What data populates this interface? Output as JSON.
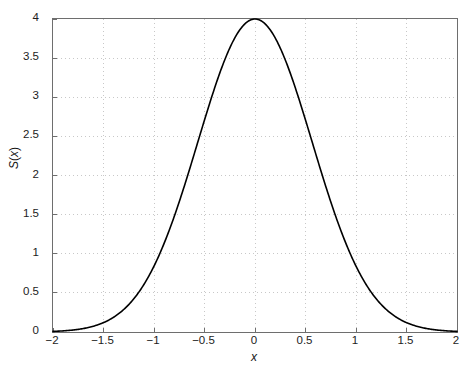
{
  "figure": {
    "background_color": "#ffffff",
    "axes_color": "#6e6e6e",
    "grid_color": "#c8c8c8",
    "curve_color": "#000000"
  },
  "axis": {
    "xlabel": "x",
    "ylabel_prefix": "S",
    "ylabel_arg": "x",
    "ylabel_full": "S(x)"
  },
  "caption_ghost": "",
  "chart_data": {
    "type": "line",
    "title": "",
    "subtitle": "",
    "xlabel": "x",
    "ylabel": "S(x)",
    "xlim": [
      -2,
      2
    ],
    "ylim": [
      0,
      4
    ],
    "grid": true,
    "grid_style": "dotted",
    "legend": null,
    "legend_position": "none",
    "xticks": [
      -2,
      -1.5,
      -1,
      -0.5,
      0,
      0.5,
      1,
      1.5,
      2
    ],
    "xticklabels": [
      "-2",
      "-1.5",
      "-1",
      "-0.5",
      "0",
      "0.5",
      "1",
      "1.5",
      "2"
    ],
    "yticks": [
      0,
      0.5,
      1,
      1.5,
      2,
      2.5,
      3,
      3.5,
      4
    ],
    "yticklabels": [
      "0",
      "0.5",
      "1",
      "1.5",
      "2",
      "2.5",
      "3",
      "3.5",
      "4"
    ],
    "series": [
      {
        "name": "S(x)",
        "color": "#000000",
        "linewidth": 1.6,
        "description": "Gaussian bell curve peaking at 4 when x = 0",
        "x": [
          -2,
          -1.9,
          -1.8,
          -1.7,
          -1.6,
          -1.5,
          -1.4,
          -1.3,
          -1.2,
          -1.1,
          -1,
          -0.9,
          -0.8,
          -0.7,
          -0.6,
          -0.5,
          -0.4,
          -0.3,
          -0.2,
          -0.1,
          0,
          0.1,
          0.2,
          0.3,
          0.4,
          0.5,
          0.6,
          0.7,
          0.8,
          0.9,
          1,
          1.1,
          1.2,
          1.3,
          1.4,
          1.5,
          1.6,
          1.7,
          1.8,
          1.9,
          2
        ],
        "y": [
          0.015,
          0.024,
          0.04,
          0.063,
          0.098,
          0.148,
          0.22,
          0.318,
          0.45,
          0.623,
          0.842,
          1.113,
          1.44,
          1.823,
          2.257,
          2.733,
          3.233,
          3.729,
          4.0,
          4.0,
          4.0,
          4.0,
          4.0,
          3.729,
          3.233,
          2.733,
          2.257,
          1.823,
          1.44,
          1.113,
          0.842,
          0.623,
          0.45,
          0.318,
          0.22,
          0.148,
          0.098,
          0.063,
          0.04,
          0.024,
          0.015
        ]
      }
    ],
    "values_at_ticks": {
      "-2": 0.015,
      "-1.5": 0.148,
      "-1": 0.842,
      "-0.5": 2.733,
      "0": 4.0,
      "0.5": 2.733,
      "1": 0.842,
      "1.5": 0.148,
      "2": 0.015
    }
  }
}
